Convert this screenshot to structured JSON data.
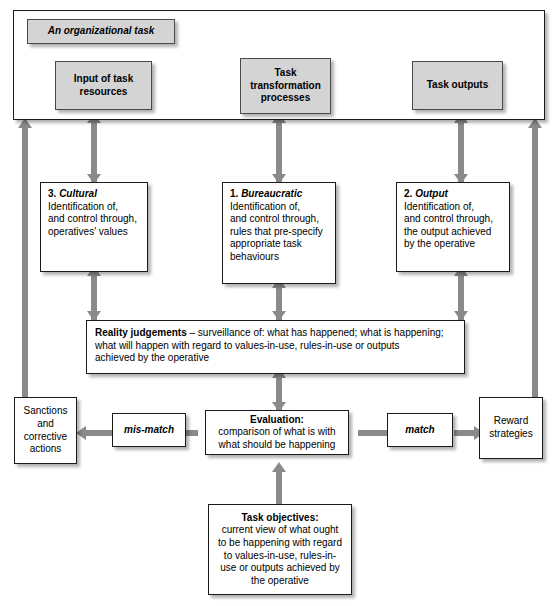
{
  "diagram": {
    "title": "An organizational task",
    "frame_label": "An organizational task",
    "top_flow": {
      "input": "Input of task resources",
      "transform": "Task transformation processes",
      "outputs": "Task outputs"
    },
    "control_boxes": [
      {
        "number": "3.",
        "kind": "Cultural",
        "lines": [
          "Identification of,",
          "and control through,",
          "operatives' values"
        ]
      },
      {
        "number": "1.",
        "kind": "Bureaucratic",
        "lines": [
          "Identification of,",
          "and control through,",
          "rules that pre-specify",
          "appropriate task",
          "behaviours"
        ]
      },
      {
        "number": "2.",
        "kind": "Output",
        "lines": [
          "Identification of,",
          "and control through,",
          "the output achieved",
          "by the operative"
        ]
      }
    ],
    "reality": {
      "title": "Reality judgements",
      "lines": [
        " – surveillance of: what has happened; what is happening;",
        "what will happen with regard to values-in-use, rules-in-use or outputs",
        "achieved by the operative"
      ]
    },
    "evaluation": {
      "title": "Evaluation:",
      "lines": [
        "comparison of what is with",
        "what  should be happening"
      ]
    },
    "mismatch_label": "mis-match",
    "match_label": "match",
    "sanctions": {
      "lines": [
        "Sanctions",
        "and",
        "corrective",
        "actions"
      ]
    },
    "reward": {
      "lines": [
        "Reward",
        "strategies"
      ]
    },
    "objectives": {
      "title": "Task objectives:",
      "lines": [
        "current view of what ought",
        "to be happening with regard",
        "to values-in-use, rules-in-",
        "use or outputs achieved by",
        "the operative"
      ]
    },
    "colors": {
      "box_fill": "#ffffff",
      "grey_fill": "#d4d4d4",
      "connector": "#8a8a8a",
      "border": "#1a1a1a",
      "text": "#000000"
    }
  }
}
